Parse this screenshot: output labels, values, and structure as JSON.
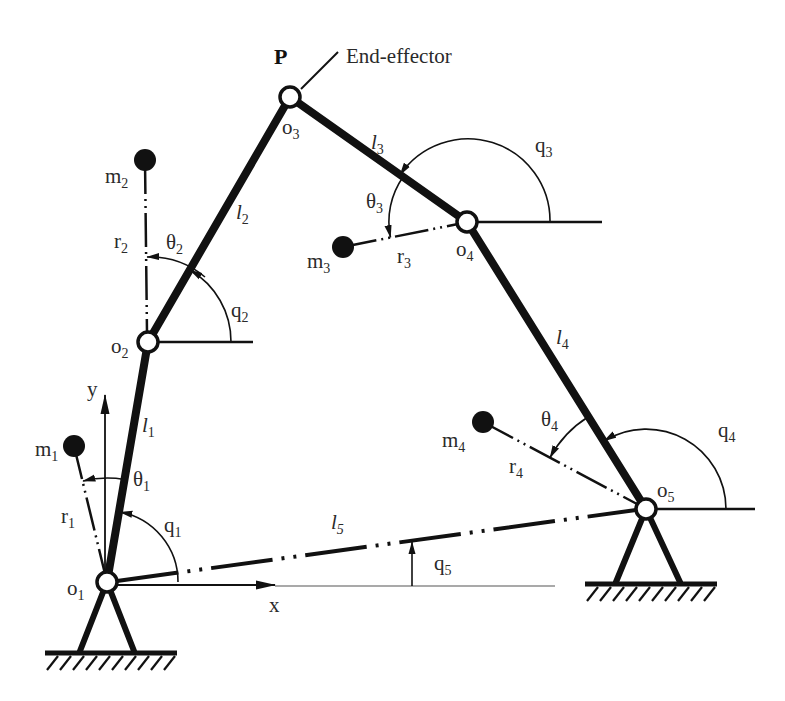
{
  "labels": {
    "P": "P",
    "end_effector": "End-effector",
    "o1": {
      "base": "o",
      "sub": "1"
    },
    "o2": {
      "base": "o",
      "sub": "2"
    },
    "o3": {
      "base": "o",
      "sub": "3"
    },
    "o4": {
      "base": "o",
      "sub": "4"
    },
    "o5": {
      "base": "o",
      "sub": "5"
    },
    "l1": {
      "base": "l",
      "sub": "1"
    },
    "l2": {
      "base": "l",
      "sub": "2"
    },
    "l3": {
      "base": "l",
      "sub": "3"
    },
    "l4": {
      "base": "l",
      "sub": "4"
    },
    "l5": {
      "base": "l",
      "sub": "5"
    },
    "m1": {
      "base": "m",
      "sub": "1"
    },
    "m2": {
      "base": "m",
      "sub": "2"
    },
    "m3": {
      "base": "m",
      "sub": "3"
    },
    "m4": {
      "base": "m",
      "sub": "4"
    },
    "r1": {
      "base": "r",
      "sub": "1"
    },
    "r2": {
      "base": "r",
      "sub": "2"
    },
    "r3": {
      "base": "r",
      "sub": "3"
    },
    "r4": {
      "base": "r",
      "sub": "4"
    },
    "q1": {
      "base": "q",
      "sub": "1"
    },
    "q2": {
      "base": "q",
      "sub": "2"
    },
    "q3": {
      "base": "q",
      "sub": "3"
    },
    "q4": {
      "base": "q",
      "sub": "4"
    },
    "q5": {
      "base": "q",
      "sub": "5"
    },
    "theta1": {
      "base": "θ",
      "sub": "1"
    },
    "theta2": {
      "base": "θ",
      "sub": "2"
    },
    "theta3": {
      "base": "θ",
      "sub": "3"
    },
    "theta4": {
      "base": "θ",
      "sub": "4"
    },
    "x_axis": "x",
    "y_axis": "y"
  },
  "diagram": {
    "type": "five-bar parallel mechanism (closed kinematic chain)",
    "joints": [
      "o1",
      "o2",
      "o3",
      "o4",
      "o5"
    ],
    "grounded_joints": [
      "o1",
      "o5"
    ],
    "links": [
      "l1",
      "l2",
      "l3",
      "l4",
      "l5"
    ],
    "point_masses": [
      "m1",
      "m2",
      "m3",
      "m4"
    ],
    "end_effector_joint": "o3"
  },
  "colors": {
    "background": "#ffffff",
    "stroke": "#111111",
    "text": "#2a2a2a",
    "joint_fill": "#ffffff",
    "mass_fill": "#111111"
  }
}
